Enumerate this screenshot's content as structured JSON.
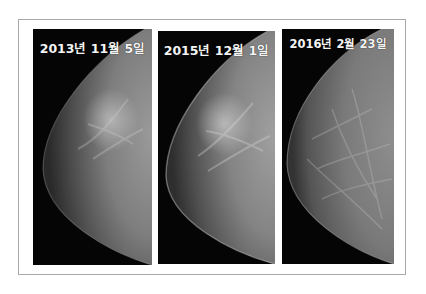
{
  "figure": {
    "panels": [
      {
        "label": "2013년 11월 5일",
        "image": "mammogram-breast-xray"
      },
      {
        "label": "2015년 12월 1일",
        "image": "mammogram-breast-xray"
      },
      {
        "label": "2016년 2월 23일",
        "image": "mammogram-breast-xray"
      }
    ],
    "colors": {
      "background": "#ffffff",
      "frame_border": "#a9a9a9",
      "panel_background": "#050505",
      "label_text": "#f4f4f4"
    }
  }
}
